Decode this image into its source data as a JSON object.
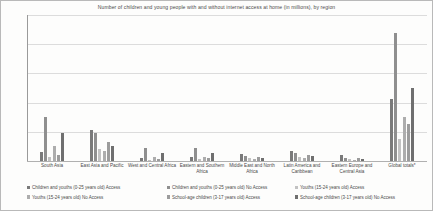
{
  "chart_data": {
    "type": "bar",
    "title": "Number of children and young people with and without internet access at home (in millions), by region",
    "xlabel": "",
    "ylabel": "",
    "ylim": [
      0,
      2500
    ],
    "yticks": [
      0,
      500,
      1000,
      1500,
      2000,
      2500
    ],
    "ytick_labels": [
      "0",
      "500",
      "1000",
      "1500",
      "2000",
      "2500"
    ],
    "grid": true,
    "legend_position": "bottom",
    "categories": [
      "South Asia",
      "East Asia and Pacific",
      "West and Central Africa",
      "Eastern and Southern Africa",
      "Middle East and North Africa",
      "Latin America and Caribbean",
      "Eastern Europe and Central Asia",
      "Global totals*"
    ],
    "series": [
      {
        "name": "Children and youths (0-25 years old) Access",
        "color": "#7a7a7a",
        "values": [
          160,
          530,
          55,
          70,
          115,
          175,
          100,
          1060
        ]
      },
      {
        "name": "Children and youths (0-25 years old) No Access",
        "color": "#8f8f8f",
        "values": [
          750,
          480,
          230,
          230,
          85,
          135,
          45,
          2200
        ]
      },
      {
        "name": "Youths (15-24 years old) Access",
        "color": "#c2c2c2",
        "values": [
          75,
          210,
          25,
          30,
          45,
          70,
          40,
          380
        ]
      },
      {
        "name": "Youths (15-24 years old) No Access",
        "color": "#adadad",
        "values": [
          260,
          170,
          70,
          75,
          30,
          50,
          18,
          760
        ]
      },
      {
        "name": "School-age children (3-17 years old) Access",
        "color": "#9c9c9c",
        "values": [
          100,
          330,
          35,
          45,
          70,
          105,
          60,
          640
        ]
      },
      {
        "name": "School-age children (3-17 years old) No Access",
        "color": "#6f6f6f",
        "values": [
          480,
          250,
          140,
          145,
          50,
          80,
          28,
          1250
        ]
      }
    ]
  }
}
